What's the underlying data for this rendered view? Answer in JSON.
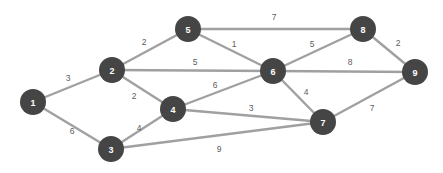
{
  "figure": {
    "title": "",
    "type": "weighted-undirected-graph",
    "background_color": "#ffffff",
    "node_color": "#454545",
    "node_label_color": "#ffffff",
    "edge_color": "#a0a0a0",
    "edge_weight_color": "#5d5d5d",
    "node_radius": 13
  },
  "chart_data": {
    "type": "diagram",
    "title": "",
    "nodes": [
      {
        "id": "1",
        "label": "1",
        "x": 33,
        "y": 102
      },
      {
        "id": "2",
        "label": "2",
        "x": 112,
        "y": 70
      },
      {
        "id": "3",
        "label": "3",
        "x": 111,
        "y": 149
      },
      {
        "id": "4",
        "label": "4",
        "x": 173,
        "y": 109
      },
      {
        "id": "5",
        "label": "5",
        "x": 188,
        "y": 29
      },
      {
        "id": "6",
        "label": "6",
        "x": 273,
        "y": 71
      },
      {
        "id": "7",
        "label": "7",
        "x": 323,
        "y": 122
      },
      {
        "id": "8",
        "label": "8",
        "x": 363,
        "y": 29
      },
      {
        "id": "9",
        "label": "9",
        "x": 415,
        "y": 72
      }
    ],
    "edges": [
      {
        "source": "1",
        "target": "2",
        "weight": "3",
        "lx": 68,
        "ly": 78
      },
      {
        "source": "1",
        "target": "3",
        "weight": "6",
        "lx": 72,
        "ly": 131
      },
      {
        "source": "2",
        "target": "5",
        "weight": "2",
        "lx": 144,
        "ly": 42
      },
      {
        "source": "2",
        "target": "6",
        "weight": "5",
        "lx": 195,
        "ly": 62
      },
      {
        "source": "2",
        "target": "4",
        "weight": "2",
        "lx": 134,
        "ly": 96
      },
      {
        "source": "3",
        "target": "4",
        "weight": "4",
        "lx": 139,
        "ly": 128
      },
      {
        "source": "3",
        "target": "7",
        "weight": "9",
        "lx": 219,
        "ly": 149
      },
      {
        "source": "4",
        "target": "6",
        "weight": "6",
        "lx": 215,
        "ly": 85
      },
      {
        "source": "4",
        "target": "7",
        "weight": "3",
        "lx": 251,
        "ly": 108
      },
      {
        "source": "5",
        "target": "6",
        "weight": "1",
        "lx": 234,
        "ly": 44
      },
      {
        "source": "5",
        "target": "8",
        "weight": "7",
        "lx": 274,
        "ly": 17
      },
      {
        "source": "6",
        "target": "8",
        "weight": "5",
        "lx": 312,
        "ly": 44
      },
      {
        "source": "6",
        "target": "9",
        "weight": "8",
        "lx": 350,
        "ly": 62
      },
      {
        "source": "6",
        "target": "7",
        "weight": "4",
        "lx": 306,
        "ly": 92
      },
      {
        "source": "7",
        "target": "9",
        "weight": "7",
        "lx": 372,
        "ly": 108
      },
      {
        "source": "8",
        "target": "9",
        "weight": "2",
        "lx": 398,
        "ly": 43
      }
    ]
  }
}
